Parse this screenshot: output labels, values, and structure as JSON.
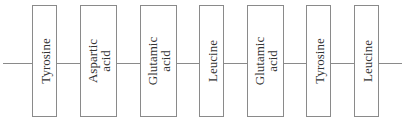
{
  "diagram": {
    "type": "polypeptide-chain",
    "residues": [
      {
        "line1": "Tyrosine",
        "line2": ""
      },
      {
        "line1": "Aspartic",
        "line2": "acid"
      },
      {
        "line1": "Glutamic",
        "line2": "acid"
      },
      {
        "line1": "Leucine",
        "line2": ""
      },
      {
        "line1": "Glutamic",
        "line2": "acid"
      },
      {
        "line1": "Tyrosine",
        "line2": ""
      },
      {
        "line1": "Leucine",
        "line2": ""
      }
    ]
  }
}
